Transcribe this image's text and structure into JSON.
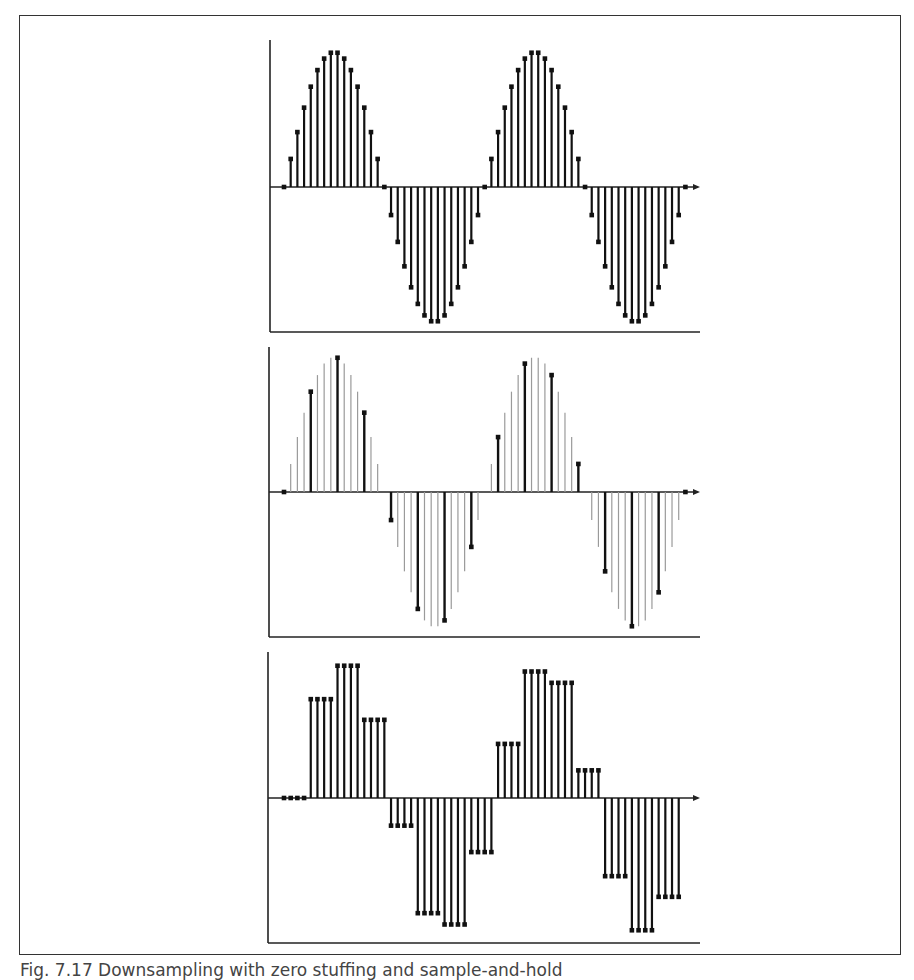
{
  "caption": "Fig. 7.17 Downsampling with zero stuffing and sample-and-hold",
  "colors": {
    "stem": "#111111",
    "ghost": "#9a9a9a",
    "axis": "#222222",
    "frame": "#333333"
  },
  "chart_data": [
    {
      "type": "stem",
      "title": "",
      "description": "Original sampled sinusoid, 30 samples per period, 2 periods",
      "xlabel": "",
      "ylabel": "",
      "n": [
        0,
        1,
        2,
        3,
        4,
        5,
        6,
        7,
        8,
        9,
        10,
        11,
        12,
        13,
        14,
        15,
        16,
        17,
        18,
        19,
        20,
        21,
        22,
        23,
        24,
        25,
        26,
        27,
        28,
        29,
        30,
        31,
        32,
        33,
        34,
        35,
        36,
        37,
        38,
        39,
        40,
        41,
        42,
        43,
        44,
        45,
        46,
        47,
        48,
        49,
        50,
        51,
        52,
        53,
        54,
        55,
        56,
        57,
        58,
        59,
        60
      ],
      "formula": "sin(2*pi*n/30)",
      "ylim": [
        -1,
        1
      ]
    },
    {
      "type": "stem",
      "description": "Downsampled by 4 (every 4th sample kept, black), discarded samples shown in gray",
      "downsample_factor": 4,
      "kept_n": [
        0,
        4,
        8,
        12,
        16,
        20,
        24,
        28,
        32,
        36,
        40,
        44,
        48,
        52,
        56,
        60
      ],
      "ylim": [
        -1,
        1
      ]
    },
    {
      "type": "stem",
      "description": "Sample-and-hold reconstruction: each kept sample held for 4 samples",
      "hold_length": 4,
      "ylim": [
        -1,
        1
      ]
    }
  ]
}
